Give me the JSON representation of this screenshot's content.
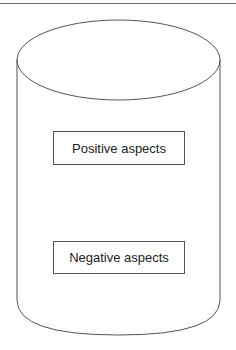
{
  "diagram": {
    "shape": "cylinder",
    "boxes": [
      {
        "label": "Positive aspects"
      },
      {
        "label": "Negative aspects"
      }
    ]
  },
  "colors": {
    "stroke": "#555555",
    "background": "#ffffff",
    "text": "#222222"
  }
}
